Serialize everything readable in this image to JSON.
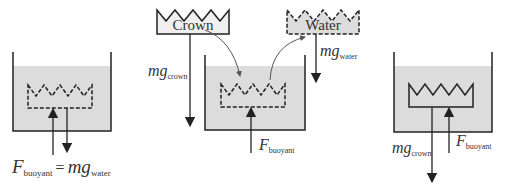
{
  "panels": [
    {
      "id": "left",
      "label_main": "F",
      "label_sub": "buoyant",
      "equals": "=",
      "rhs_main": "mg",
      "rhs_sub": "water"
    },
    {
      "id": "middle",
      "crown_label": "Crown",
      "water_label": "Water",
      "mg_crown_main": "mg",
      "mg_crown_sub": "crown",
      "mg_water_main": "mg",
      "mg_water_sub": "water",
      "f_main": "F",
      "f_sub": "buoyant"
    },
    {
      "id": "right",
      "mg_main": "mg",
      "mg_sub": "crown",
      "f_main": "F",
      "f_sub": "buoyant"
    }
  ],
  "colors": {
    "water": "#dcdcdc",
    "stroke": "#222222"
  }
}
